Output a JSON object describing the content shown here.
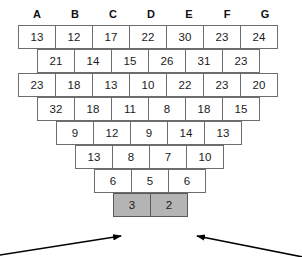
{
  "headers": {
    "labels": [
      "A",
      "B",
      "C",
      "D",
      "E",
      "F",
      "G"
    ]
  },
  "colors": {
    "shaded_cell": "#b4b4b4",
    "cell_border": "#6d6d6d",
    "cell_background": "#ffffff",
    "text": "#1a1a1a",
    "arrow": "#000000"
  },
  "chart_data": {
    "type": "table",
    "title": "",
    "xlabel": "",
    "ylabel": "",
    "columns": [
      "A",
      "B",
      "C",
      "D",
      "E",
      "F",
      "G"
    ],
    "rows": [
      {
        "index": 1,
        "offset": false,
        "values": [
          13,
          12,
          17,
          22,
          30,
          23,
          24
        ]
      },
      {
        "index": 2,
        "offset": true,
        "values": [
          21,
          14,
          15,
          26,
          31,
          23
        ]
      },
      {
        "index": 3,
        "offset": false,
        "values": [
          23,
          18,
          13,
          10,
          22,
          23,
          20
        ]
      },
      {
        "index": 4,
        "offset": true,
        "values": [
          32,
          18,
          11,
          8,
          18,
          15
        ]
      },
      {
        "index": 5,
        "offset": true,
        "values": [
          9,
          12,
          9,
          14,
          13
        ]
      },
      {
        "index": 6,
        "offset": true,
        "values": [
          13,
          8,
          7,
          10
        ]
      },
      {
        "index": 7,
        "offset": true,
        "values": [
          6,
          5,
          6
        ]
      },
      {
        "index": 8,
        "offset": true,
        "values": [
          3,
          2
        ],
        "shaded": true
      }
    ],
    "annotations": [
      {
        "name": "left-arrow",
        "points_to": "3",
        "from": "bottom-left"
      },
      {
        "name": "right-arrow",
        "points_to": "2",
        "from": "bottom-right"
      }
    ]
  }
}
